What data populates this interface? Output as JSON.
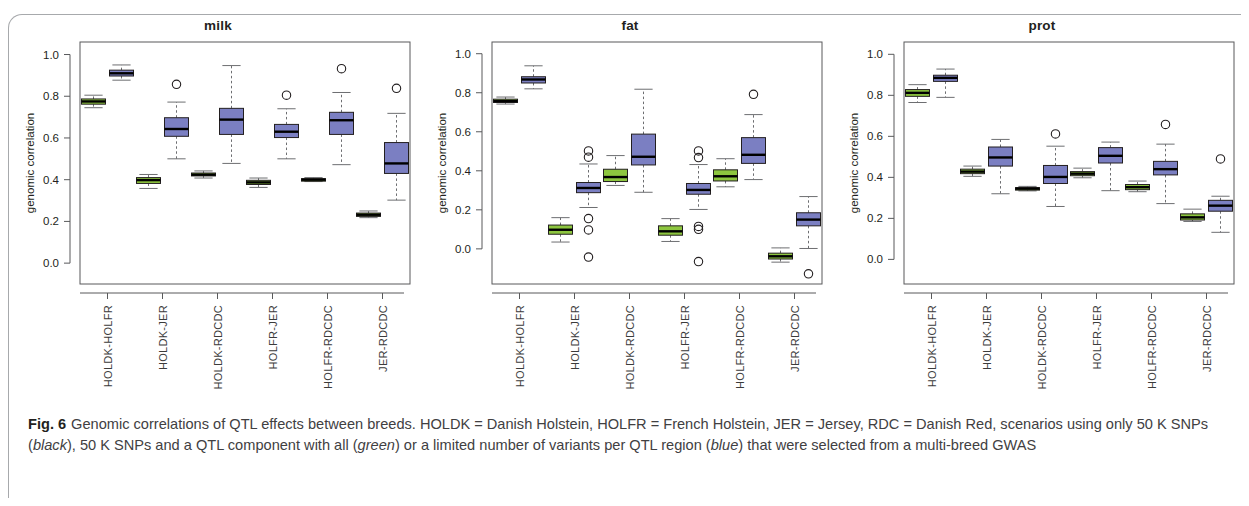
{
  "figure": {
    "number_label": "Fig. 6",
    "caption_segments": [
      {
        "text": "Genomic correlations of QTL effects between breeds. HOLDK = Danish Holstein, HOLFR = French Holstein, JER = Jersey, RDC = Danish Red, scenarios using only 50 K SNPs (",
        "style": "normal"
      },
      {
        "text": "black",
        "style": "italic"
      },
      {
        "text": "), 50 K SNPs and a QTL component with all (",
        "style": "normal"
      },
      {
        "text": "green",
        "style": "italic"
      },
      {
        "text": ") or a limited number of variants per QTL region (",
        "style": "normal"
      },
      {
        "text": "blue",
        "style": "italic"
      },
      {
        "text": ") that were selected from a multi-breed GWAS",
        "style": "normal"
      }
    ],
    "caption_plain": "Fig. 6 Genomic correlations of QTL effects between breeds. HOLDK = Danish Holstein, HOLFR = French Holstein, JER = Jersey, RDC = Danish Red, scenarios using only 50 K SNPs (black), 50 K SNPs and a QTL component with all (green) or a limited number of variants per QTL region (blue) that were selected from a multi-breed GWAS"
  },
  "colors": {
    "green": "#8DC63F",
    "blue": "#7B7FC2",
    "axis": "#58595b",
    "text": "#231f20",
    "caption_text": "#414042",
    "frame": "#a7a9ac"
  },
  "chart_data": [
    {
      "type": "box",
      "title": "milk",
      "xlabel": "",
      "ylabel": "genomic correlation",
      "ylim": [
        -0.1,
        1.06
      ],
      "yticks": [
        0.0,
        0.2,
        0.4,
        0.6,
        0.8,
        1.0
      ],
      "ytick_labels": [
        "0.0",
        "0.2",
        "0.4",
        "0.6",
        "0.8",
        "1.0"
      ],
      "grid": false,
      "legend": [
        "black",
        "green",
        "blue"
      ],
      "categories": [
        "HOLDK-HOLFR",
        "HOLDK-JER",
        "HOLDK-RDCDC",
        "HOLFR-JER",
        "HOLFR-RDCDC",
        "JER-RDCDC"
      ],
      "boxes": [
        {
          "group": "HOLDK-HOLFR",
          "series": "green",
          "q1": 0.762,
          "median": 0.775,
          "q3": 0.787,
          "whisker_low": 0.745,
          "whisker_high": 0.805,
          "outliers": []
        },
        {
          "group": "HOLDK-HOLFR",
          "series": "blue",
          "q1": 0.897,
          "median": 0.91,
          "q3": 0.925,
          "whisker_low": 0.877,
          "whisker_high": 0.95,
          "outliers": []
        },
        {
          "group": "HOLDK-JER",
          "series": "green",
          "q1": 0.382,
          "median": 0.398,
          "q3": 0.41,
          "whisker_low": 0.358,
          "whisker_high": 0.425,
          "outliers": []
        },
        {
          "group": "HOLDK-JER",
          "series": "blue",
          "q1": 0.608,
          "median": 0.643,
          "q3": 0.697,
          "whisker_low": 0.5,
          "whisker_high": 0.772,
          "outliers": [
            0.857
          ]
        },
        {
          "group": "HOLDK-RDCDC",
          "series": "green",
          "q1": 0.418,
          "median": 0.424,
          "q3": 0.432,
          "whisker_low": 0.408,
          "whisker_high": 0.442,
          "outliers": []
        },
        {
          "group": "HOLDK-RDCDC",
          "series": "blue",
          "q1": 0.617,
          "median": 0.688,
          "q3": 0.742,
          "whisker_low": 0.478,
          "whisker_high": 0.947,
          "outliers": []
        },
        {
          "group": "HOLFR-JER",
          "series": "green",
          "q1": 0.377,
          "median": 0.387,
          "q3": 0.397,
          "whisker_low": 0.363,
          "whisker_high": 0.408,
          "outliers": []
        },
        {
          "group": "HOLFR-JER",
          "series": "blue",
          "q1": 0.602,
          "median": 0.63,
          "q3": 0.665,
          "whisker_low": 0.5,
          "whisker_high": 0.74,
          "outliers": [
            0.805
          ]
        },
        {
          "group": "HOLFR-RDCDC",
          "series": "green",
          "q1": 0.396,
          "median": 0.4,
          "q3": 0.405,
          "whisker_low": 0.391,
          "whisker_high": 0.41,
          "outliers": []
        },
        {
          "group": "HOLFR-RDCDC",
          "series": "blue",
          "q1": 0.617,
          "median": 0.685,
          "q3": 0.723,
          "whisker_low": 0.472,
          "whisker_high": 0.818,
          "outliers": [
            0.932
          ]
        },
        {
          "group": "JER-RDCDC",
          "series": "green",
          "q1": 0.224,
          "median": 0.232,
          "q3": 0.24,
          "whisker_low": 0.218,
          "whisker_high": 0.25,
          "outliers": []
        },
        {
          "group": "JER-RDCDC",
          "series": "blue",
          "q1": 0.43,
          "median": 0.478,
          "q3": 0.578,
          "whisker_low": 0.302,
          "whisker_high": 0.718,
          "outliers": [
            0.838
          ]
        }
      ]
    },
    {
      "type": "box",
      "title": "fat",
      "xlabel": "",
      "ylabel": "genomic correlation",
      "ylim": [
        -0.18,
        1.06
      ],
      "yticks": [
        0.0,
        0.2,
        0.4,
        0.6,
        0.8,
        1.0
      ],
      "ytick_labels": [
        "0.0",
        "0.2",
        "0.4",
        "0.6",
        "0.8",
        "1.0"
      ],
      "grid": false,
      "legend": [
        "black",
        "green",
        "blue"
      ],
      "categories": [
        "HOLDK-HOLFR",
        "HOLDK-JER",
        "HOLDK-RDCDC",
        "HOLFR-JER",
        "HOLFR-RDCDC",
        "JER-RDCDC"
      ],
      "boxes": [
        {
          "group": "HOLDK-HOLFR",
          "series": "green",
          "q1": 0.75,
          "median": 0.757,
          "q3": 0.767,
          "whisker_low": 0.742,
          "whisker_high": 0.778,
          "outliers": []
        },
        {
          "group": "HOLDK-HOLFR",
          "series": "blue",
          "q1": 0.85,
          "median": 0.868,
          "q3": 0.882,
          "whisker_low": 0.82,
          "whisker_high": 0.938,
          "outliers": []
        },
        {
          "group": "HOLDK-JER",
          "series": "green",
          "q1": 0.075,
          "median": 0.098,
          "q3": 0.122,
          "whisker_low": 0.035,
          "whisker_high": 0.16,
          "outliers": []
        },
        {
          "group": "HOLDK-JER",
          "series": "blue",
          "q1": 0.288,
          "median": 0.312,
          "q3": 0.34,
          "whisker_low": 0.212,
          "whisker_high": 0.435,
          "outliers": [
            0.502,
            0.47,
            0.155,
            0.097,
            -0.042
          ]
        },
        {
          "group": "HOLDK-RDCDC",
          "series": "green",
          "q1": 0.345,
          "median": 0.368,
          "q3": 0.408,
          "whisker_low": 0.325,
          "whisker_high": 0.478,
          "outliers": []
        },
        {
          "group": "HOLDK-RDCDC",
          "series": "blue",
          "q1": 0.43,
          "median": 0.472,
          "q3": 0.588,
          "whisker_low": 0.29,
          "whisker_high": 0.818,
          "outliers": []
        },
        {
          "group": "HOLFR-JER",
          "series": "green",
          "q1": 0.07,
          "median": 0.09,
          "q3": 0.118,
          "whisker_low": 0.038,
          "whisker_high": 0.155,
          "outliers": []
        },
        {
          "group": "HOLFR-JER",
          "series": "blue",
          "q1": 0.28,
          "median": 0.302,
          "q3": 0.335,
          "whisker_low": 0.202,
          "whisker_high": 0.432,
          "outliers": [
            0.502,
            0.468,
            0.115,
            0.1,
            -0.065
          ]
        },
        {
          "group": "HOLFR-RDCDC",
          "series": "green",
          "q1": 0.348,
          "median": 0.372,
          "q3": 0.405,
          "whisker_low": 0.318,
          "whisker_high": 0.462,
          "outliers": []
        },
        {
          "group": "HOLFR-RDCDC",
          "series": "blue",
          "q1": 0.438,
          "median": 0.482,
          "q3": 0.57,
          "whisker_low": 0.355,
          "whisker_high": 0.688,
          "outliers": [
            0.792
          ]
        },
        {
          "group": "JER-RDCDC",
          "series": "green",
          "q1": -0.052,
          "median": -0.038,
          "q3": -0.022,
          "whisker_low": -0.068,
          "whisker_high": 0.005,
          "outliers": []
        },
        {
          "group": "JER-RDCDC",
          "series": "blue",
          "q1": 0.118,
          "median": 0.15,
          "q3": 0.185,
          "whisker_low": 0.002,
          "whisker_high": 0.268,
          "outliers": [
            -0.128
          ]
        }
      ]
    },
    {
      "type": "box",
      "title": "prot",
      "xlabel": "",
      "ylabel": "genomic correlation",
      "ylim": [
        -0.12,
        1.06
      ],
      "yticks": [
        0.0,
        0.2,
        0.4,
        0.6,
        0.8,
        1.0
      ],
      "ytick_labels": [
        "0.0",
        "0.2",
        "0.4",
        "0.6",
        "0.8",
        "1.0"
      ],
      "grid": false,
      "legend": [
        "black",
        "green",
        "blue"
      ],
      "categories": [
        "HOLDK-HOLFR",
        "HOLDK-JER",
        "HOLDK-RDCDC",
        "HOLFR-JER",
        "HOLFR-RDCDC",
        "JER-RDCDC"
      ],
      "boxes": [
        {
          "group": "HOLDK-HOLFR",
          "series": "green",
          "q1": 0.795,
          "median": 0.812,
          "q3": 0.828,
          "whisker_low": 0.765,
          "whisker_high": 0.852,
          "outliers": []
        },
        {
          "group": "HOLDK-HOLFR",
          "series": "blue",
          "q1": 0.868,
          "median": 0.885,
          "q3": 0.898,
          "whisker_low": 0.79,
          "whisker_high": 0.928,
          "outliers": []
        },
        {
          "group": "HOLDK-JER",
          "series": "green",
          "q1": 0.418,
          "median": 0.428,
          "q3": 0.44,
          "whisker_low": 0.405,
          "whisker_high": 0.455,
          "outliers": []
        },
        {
          "group": "HOLDK-JER",
          "series": "blue",
          "q1": 0.455,
          "median": 0.497,
          "q3": 0.548,
          "whisker_low": 0.32,
          "whisker_high": 0.585,
          "outliers": []
        },
        {
          "group": "HOLDK-RDCDC",
          "series": "green",
          "q1": 0.34,
          "median": 0.345,
          "q3": 0.35,
          "whisker_low": 0.334,
          "whisker_high": 0.356,
          "outliers": []
        },
        {
          "group": "HOLDK-RDCDC",
          "series": "blue",
          "q1": 0.37,
          "median": 0.402,
          "q3": 0.458,
          "whisker_low": 0.258,
          "whisker_high": 0.552,
          "outliers": [
            0.612
          ]
        },
        {
          "group": "HOLFR-JER",
          "series": "green",
          "q1": 0.408,
          "median": 0.418,
          "q3": 0.428,
          "whisker_low": 0.398,
          "whisker_high": 0.445,
          "outliers": []
        },
        {
          "group": "HOLFR-JER",
          "series": "blue",
          "q1": 0.47,
          "median": 0.505,
          "q3": 0.545,
          "whisker_low": 0.335,
          "whisker_high": 0.572,
          "outliers": []
        },
        {
          "group": "HOLFR-RDCDC",
          "series": "green",
          "q1": 0.34,
          "median": 0.352,
          "q3": 0.365,
          "whisker_low": 0.33,
          "whisker_high": 0.382,
          "outliers": []
        },
        {
          "group": "HOLFR-RDCDC",
          "series": "blue",
          "q1": 0.412,
          "median": 0.44,
          "q3": 0.478,
          "whisker_low": 0.272,
          "whisker_high": 0.562,
          "outliers": [
            0.658
          ]
        },
        {
          "group": "JER-RDCDC",
          "series": "green",
          "q1": 0.192,
          "median": 0.205,
          "q3": 0.222,
          "whisker_low": 0.185,
          "whisker_high": 0.245,
          "outliers": []
        },
        {
          "group": "JER-RDCDC",
          "series": "blue",
          "q1": 0.235,
          "median": 0.262,
          "q3": 0.288,
          "whisker_low": 0.132,
          "whisker_high": 0.308,
          "outliers": [
            0.49
          ]
        }
      ]
    }
  ]
}
